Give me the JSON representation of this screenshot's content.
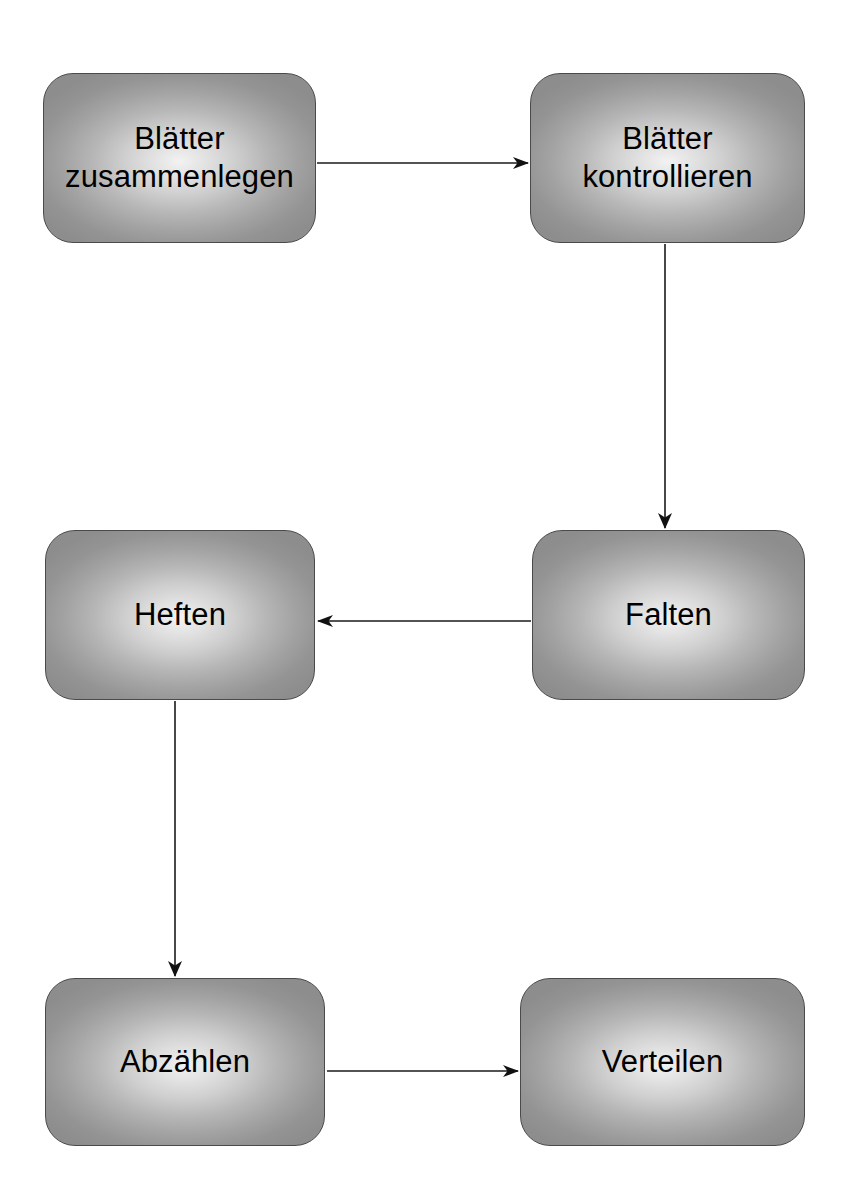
{
  "diagram": {
    "background_color": "#ffffff",
    "node_fill_center": "#f2f2f2",
    "node_fill_edge": "#8d8d8d",
    "node_border_color": "#4a4a4a",
    "text_color": "#000000",
    "edge_color": "#1a1a1a",
    "nodes": [
      {
        "id": "blaetter-zusammenlegen",
        "label": "Blätter\nzusammenlegen",
        "x": 43,
        "y": 73,
        "width": 273,
        "height": 170
      },
      {
        "id": "blaetter-kontrollieren",
        "label": "Blätter\nkontrollieren",
        "x": 530,
        "y": 73,
        "width": 275,
        "height": 170
      },
      {
        "id": "heften",
        "label": "Heften",
        "x": 45,
        "y": 530,
        "width": 270,
        "height": 170
      },
      {
        "id": "falten",
        "label": "Falten",
        "x": 532,
        "y": 530,
        "width": 273,
        "height": 170
      },
      {
        "id": "abzaehlen",
        "label": "Abzählen",
        "x": 45,
        "y": 978,
        "width": 280,
        "height": 168
      },
      {
        "id": "verteilen",
        "label": "Verteilen",
        "x": 520,
        "y": 978,
        "width": 285,
        "height": 168
      }
    ],
    "edges": [
      {
        "id": "edge-zusammenlegen-to-kontrollieren",
        "from": "blaetter-zusammenlegen",
        "to": "blaetter-kontrollieren",
        "direction": "right",
        "x1": 317,
        "y1": 163,
        "x2": 528,
        "y2": 163
      },
      {
        "id": "edge-kontrollieren-to-falten",
        "from": "blaetter-kontrollieren",
        "to": "falten",
        "direction": "down",
        "x1": 665,
        "y1": 244,
        "x2": 665,
        "y2": 528
      },
      {
        "id": "edge-falten-to-heften",
        "from": "falten",
        "to": "heften",
        "direction": "left",
        "x1": 531,
        "y1": 621,
        "x2": 318,
        "y2": 621
      },
      {
        "id": "edge-heften-to-abzaehlen",
        "from": "heften",
        "to": "abzaehlen",
        "direction": "down",
        "x1": 175,
        "y1": 701,
        "x2": 175,
        "y2": 976
      },
      {
        "id": "edge-abzaehlen-to-verteilen",
        "from": "abzaehlen",
        "to": "verteilen",
        "direction": "right",
        "x1": 327,
        "y1": 1071,
        "x2": 518,
        "y2": 1071
      }
    ]
  }
}
